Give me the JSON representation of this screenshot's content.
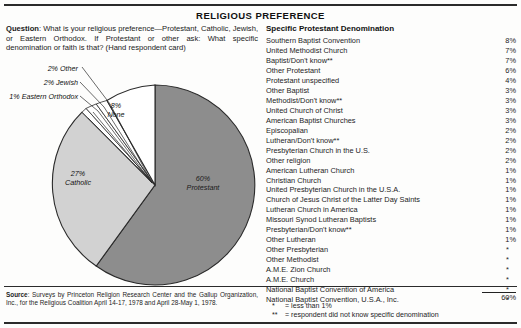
{
  "title": "RELIGIOUS PREFERENCE",
  "question": {
    "label": "Question",
    "text": ": What is your religious preference—Protestant, Catholic, Jewish, or Eastern Orthodox. If Protestant or other ask: What specific denomination or faith is that? (Hand respondent card)"
  },
  "pie": {
    "callouts": [
      {
        "name": "other",
        "label": "2% Other"
      },
      {
        "name": "jewish",
        "label": "2% Jewish"
      },
      {
        "name": "eastern-orthodox",
        "label": "1% Eastern Orthodox"
      }
    ],
    "slices": [
      {
        "name": "protestant",
        "pct_label": "60%",
        "name_label": "Protestant"
      },
      {
        "name": "catholic",
        "pct_label": "27%",
        "name_label": "Catholic"
      },
      {
        "name": "none",
        "pct_label": "8%",
        "name_label": "None"
      }
    ],
    "colors": {
      "protestant": "#8d8d8d",
      "catholic": "#d2d2d2",
      "none": "#ffffff",
      "other": "#ffffff",
      "jewish": "#ffffff",
      "eastern_orthodox": "#ffffff",
      "outline": "#2a2a2a"
    }
  },
  "denominations": {
    "heading": "Specific Protestant Denomination",
    "rows": [
      {
        "name": "Southern Baptist Convention",
        "value": "8%"
      },
      {
        "name": "United Methodist Church",
        "value": "7%"
      },
      {
        "name": "Baptist/Don't know**",
        "value": "7%"
      },
      {
        "name": "Other Protestant",
        "value": "6%"
      },
      {
        "name": "Protestant unspecified",
        "value": "4%"
      },
      {
        "name": "Other Baptist",
        "value": "3%"
      },
      {
        "name": "Methodist/Don't know**",
        "value": "3%"
      },
      {
        "name": "United Church of Christ",
        "value": "3%"
      },
      {
        "name": "American Baptist Churches",
        "value": "3%"
      },
      {
        "name": "Episcopalian",
        "value": "2%"
      },
      {
        "name": "Lutheran/Don't know**",
        "value": "2%"
      },
      {
        "name": "Presbyterian Church in the U.S.",
        "value": "2%"
      },
      {
        "name": "Other religion",
        "value": "2%"
      },
      {
        "name": "American Lutheran Church",
        "value": "1%"
      },
      {
        "name": "Christian Church",
        "value": "1%"
      },
      {
        "name": "United Presbyterian Church in the U.S.A.",
        "value": "1%"
      },
      {
        "name": "Church of Jesus Christ of the Latter Day Saints",
        "value": "1%"
      },
      {
        "name": "Lutheran Church in America",
        "value": "1%"
      },
      {
        "name": "Missouri Synod Lutheran Baptists",
        "value": "1%"
      },
      {
        "name": "Presbyterian/Don't know**",
        "value": "1%"
      },
      {
        "name": "Other Lutheran",
        "value": "1%"
      },
      {
        "name": "Other Presbyterian",
        "value": "*"
      },
      {
        "name": "Other Methodist",
        "value": "*"
      },
      {
        "name": "A.M.E. Zion Church",
        "value": "*"
      },
      {
        "name": "A.M.E. Church",
        "value": "*"
      },
      {
        "name": "National Baptist Convention of America",
        "value": "*"
      },
      {
        "name": "National Baptist Convention, U.S.A., Inc.",
        "value": "*"
      }
    ],
    "total": "60%"
  },
  "footnotes": [
    {
      "marker": "*",
      "text": "= less than 1%"
    },
    {
      "marker": "**",
      "text": "= respondent did not know specific denomination"
    }
  ],
  "source": {
    "label": "Source",
    "text": ": Surveys by Princeton Religion Research Center and the Gallup Organization, Inc., for the Religious Coalition April 14-17, 1978 and April 28-May 1, 1978."
  },
  "chart_data": {
    "type": "pie",
    "title": "RELIGIOUS PREFERENCE",
    "categories": [
      "Protestant",
      "Catholic",
      "None",
      "Other",
      "Jewish",
      "Eastern Orthodox"
    ],
    "values": [
      60,
      27,
      8,
      2,
      2,
      1
    ],
    "unit": "percent",
    "legend": "labels-on-slices-and-leader-lines",
    "colors": [
      "#8d8d8d",
      "#d2d2d2",
      "#ffffff",
      "#ffffff",
      "#ffffff",
      "#ffffff"
    ],
    "start_angle_deg": 0,
    "direction": "clockwise",
    "secondary_table": {
      "type": "table",
      "title": "Specific Protestant Denomination",
      "columns": [
        "Denomination",
        "Percent"
      ],
      "rows": [
        [
          "Southern Baptist Convention",
          "8%"
        ],
        [
          "United Methodist Church",
          "7%"
        ],
        [
          "Baptist/Don't know**",
          "7%"
        ],
        [
          "Other Protestant",
          "6%"
        ],
        [
          "Protestant unspecified",
          "4%"
        ],
        [
          "Other Baptist",
          "3%"
        ],
        [
          "Methodist/Don't know**",
          "3%"
        ],
        [
          "United Church of Christ",
          "3%"
        ],
        [
          "American Baptist Churches",
          "3%"
        ],
        [
          "Episcopalian",
          "2%"
        ],
        [
          "Lutheran/Don't know**",
          "2%"
        ],
        [
          "Presbyterian Church in the U.S.",
          "2%"
        ],
        [
          "Other religion",
          "2%"
        ],
        [
          "American Lutheran Church",
          "1%"
        ],
        [
          "Christian Church",
          "1%"
        ],
        [
          "United Presbyterian Church in the U.S.A.",
          "1%"
        ],
        [
          "Church of Jesus Christ of the Latter Day Saints",
          "1%"
        ],
        [
          "Lutheran Church in America",
          "1%"
        ],
        [
          "Missouri Synod Lutheran Baptists",
          "1%"
        ],
        [
          "Presbyterian/Don't know**",
          "1%"
        ],
        [
          "Other Lutheran",
          "1%"
        ],
        [
          "Other Presbyterian",
          "*"
        ],
        [
          "Other Methodist",
          "*"
        ],
        [
          "A.M.E. Zion Church",
          "*"
        ],
        [
          "A.M.E. Church",
          "*"
        ],
        [
          "National Baptist Convention of America",
          "*"
        ],
        [
          "National Baptist Convention, U.S.A., Inc.",
          "*"
        ]
      ],
      "total": "60%"
    }
  }
}
